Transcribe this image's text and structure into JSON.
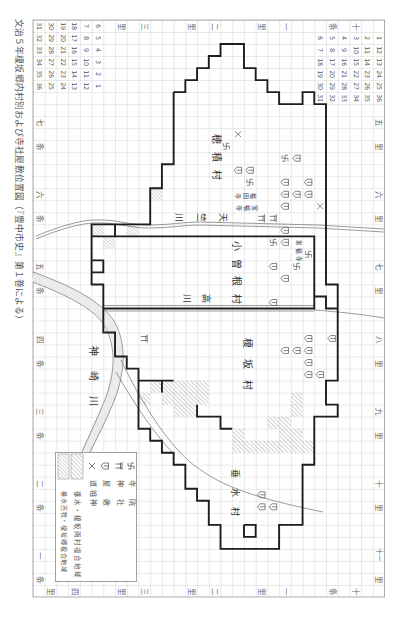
{
  "title": "文治５年榎坂郷内村別および寺社屋敷位置図（『豊中市史』第１巻による）",
  "colors": {
    "ink": "#1e1e1e",
    "grid": "#b4b4b4",
    "grid_border": "#9a9a9a",
    "line": "#707070",
    "symbol": "#666666",
    "river_fill": "#ebebeb",
    "hatch": "#8c8c8c"
  },
  "map": {
    "grid": {
      "x": 33,
      "y": 20,
      "cw": 11.72,
      "ch": 12.02,
      "cols": 30,
      "rows": 48
    },
    "number_blocks": [
      {
        "id": "left",
        "col": 0,
        "row": 0,
        "columns": [
          [
            "31",
            "32",
            "33",
            "34",
            "35",
            "36"
          ],
          [
            "30",
            "29",
            "28",
            "27",
            "26",
            "25"
          ],
          [
            "19",
            "20",
            "21",
            "22",
            "23",
            "24"
          ],
          [
            "18",
            "17",
            "16",
            "15",
            "14",
            "13"
          ],
          [
            "7",
            "8",
            "9",
            "10",
            "11",
            "12"
          ],
          [
            "6",
            "5",
            "4",
            "3",
            "2",
            "1"
          ]
        ]
      },
      {
        "id": "right",
        "col": 24,
        "row": 1,
        "columns": [
          [
            "6",
            "7",
            "18",
            "19",
            "30",
            "31"
          ],
          [
            "5",
            "8",
            "17",
            "20",
            "29",
            "32"
          ],
          [
            "4",
            "9",
            "16",
            "21",
            "28",
            "33"
          ],
          [
            "3",
            "10",
            "15",
            "22",
            "27",
            "34"
          ],
          [
            "2",
            "11",
            "14",
            "23",
            "26",
            "35"
          ],
          [
            "1",
            "12",
            "13",
            "24",
            "25",
            "36"
          ]
        ]
      }
    ],
    "grid_labels": [
      {
        "t": "七",
        "c": 0,
        "r": 8
      },
      {
        "t": "条",
        "c": 0,
        "r": 10
      },
      {
        "t": "六",
        "c": 0,
        "r": 14
      },
      {
        "t": "条",
        "c": 0,
        "r": 16
      },
      {
        "t": "五",
        "c": 0,
        "r": 20
      },
      {
        "t": "条",
        "c": 0,
        "r": 22
      },
      {
        "t": "四",
        "c": 0,
        "r": 26
      },
      {
        "t": "条",
        "c": 0,
        "r": 28
      },
      {
        "t": "三",
        "c": 0,
        "r": 32
      },
      {
        "t": "条",
        "c": 0,
        "r": 34
      },
      {
        "t": "二",
        "c": 0,
        "r": 38
      },
      {
        "t": "条",
        "c": 0,
        "r": 40
      },
      {
        "t": "一",
        "c": 0,
        "r": 44
      },
      {
        "t": "条",
        "c": 0,
        "r": 46
      },
      {
        "t": "五",
        "c": 29,
        "r": 8
      },
      {
        "t": "里",
        "c": 29,
        "r": 10
      },
      {
        "t": "六",
        "c": 29,
        "r": 14
      },
      {
        "t": "里",
        "c": 29,
        "r": 16
      },
      {
        "t": "七",
        "c": 29,
        "r": 20
      },
      {
        "t": "里",
        "c": 29,
        "r": 22
      },
      {
        "t": "八",
        "c": 29,
        "r": 26
      },
      {
        "t": "里",
        "c": 29,
        "r": 28
      },
      {
        "t": "九",
        "c": 29,
        "r": 32
      },
      {
        "t": "里",
        "c": 29,
        "r": 34
      },
      {
        "t": "十",
        "c": 29,
        "r": 38
      },
      {
        "t": "里",
        "c": 29,
        "r": 40
      },
      {
        "t": "十一",
        "c": 29,
        "r": 44
      },
      {
        "t": "里",
        "c": 29,
        "r": 46
      },
      {
        "t": "里",
        "c": 7,
        "r": 0
      },
      {
        "t": "三",
        "c": 9,
        "r": 0
      },
      {
        "t": "里",
        "c": 13,
        "r": 0
      },
      {
        "t": "二",
        "c": 15,
        "r": 0
      },
      {
        "t": "里",
        "c": 19,
        "r": 0
      },
      {
        "t": "一",
        "c": 21,
        "r": 0
      },
      {
        "t": "条",
        "c": 25,
        "r": 0
      },
      {
        "t": "十",
        "c": 27,
        "r": 0
      },
      {
        "t": "里",
        "c": 1,
        "r": 47
      },
      {
        "t": "四",
        "c": 3,
        "r": 47
      },
      {
        "t": "里",
        "c": 7,
        "r": 47
      },
      {
        "t": "三",
        "c": 9,
        "r": 47
      },
      {
        "t": "里",
        "c": 13,
        "r": 47
      },
      {
        "t": "二",
        "c": 15,
        "r": 47
      },
      {
        "t": "里",
        "c": 19,
        "r": 47
      },
      {
        "t": "一",
        "c": 21,
        "r": 47
      },
      {
        "t": "条",
        "c": 25,
        "r": 47
      },
      {
        "t": "十",
        "c": 27,
        "r": 47
      }
    ],
    "place_names": [
      {
        "id": "hozumi-village-label",
        "text": "穂積村",
        "x": 216,
        "y": 161,
        "size": 10,
        "span": 54,
        "dir": "tb"
      },
      {
        "id": "kosone-village-label",
        "text": "小曽根村",
        "x": 236,
        "y": 276,
        "size": 10,
        "span": 70,
        "dir": "tb"
      },
      {
        "id": "enosaka-village-label",
        "text": "榎坂村",
        "x": 247,
        "y": 369,
        "size": 10,
        "span": 63,
        "dir": "tb"
      },
      {
        "id": "tarumi-village-label",
        "text": "垂水村",
        "x": 234,
        "y": 497,
        "size": 9,
        "span": 57,
        "dir": "tb"
      },
      {
        "id": "kanzaki-river-label",
        "text": "神崎川",
        "x": 93,
        "y": 383,
        "size": 10,
        "span": 75,
        "dir": "tb"
      },
      {
        "id": "tenjiku-river-label",
        "text": "天竺川",
        "x": 195,
        "y": 217,
        "size": 9,
        "span": 66,
        "dir": "rl"
      },
      {
        "id": "takagawa-river-label",
        "text": "高川",
        "x": 192,
        "y": 298,
        "size": 9,
        "span": 38,
        "dir": "rl"
      },
      {
        "id": "temple-name-label",
        "text": "福田寺",
        "x": 245,
        "y": 195,
        "size": 6,
        "span": 22,
        "dir": "rl"
      },
      {
        "id": "temple-name-label",
        "text": "宝福寺",
        "x": 246,
        "y": 207,
        "size": 6,
        "span": 24,
        "dir": "rl"
      },
      {
        "id": "temple-name-label",
        "text": "常福寺",
        "x": 298,
        "y": 252,
        "size": 5.5,
        "span": 22,
        "dir": "tb"
      }
    ],
    "symbols": {
      "house": [
        [
          22,
          11
        ],
        [
          21,
          13
        ],
        [
          23,
          13
        ],
        [
          21,
          14
        ],
        [
          22,
          14
        ],
        [
          23,
          14
        ],
        [
          21,
          15
        ],
        [
          21,
          17
        ],
        [
          21,
          18
        ],
        [
          20,
          20
        ],
        [
          21,
          21
        ],
        [
          17,
          12
        ],
        [
          18,
          12
        ],
        [
          20,
          23
        ],
        [
          23,
          26
        ],
        [
          25,
          26
        ],
        [
          21,
          27
        ],
        [
          22,
          27
        ],
        [
          23,
          27
        ],
        [
          23,
          28
        ],
        [
          23,
          29
        ],
        [
          24,
          29
        ],
        [
          19,
          39
        ],
        [
          19,
          40
        ],
        [
          20,
          40
        ]
      ],
      "temple": [
        [
          16,
          10
        ],
        [
          18,
          13
        ],
        [
          21,
          11
        ],
        [
          20,
          18
        ],
        [
          23,
          19
        ],
        [
          22,
          20
        ]
      ],
      "shrine": [
        [
          19,
          16
        ],
        [
          20,
          16
        ],
        [
          9,
          26
        ]
      ],
      "dosojin": [
        [
          17,
          9
        ],
        [
          24,
          15
        ]
      ]
    },
    "hatched_cells": {
      "a": [
        [
          10,
          30
        ],
        [
          11,
          30
        ],
        [
          12,
          30
        ],
        [
          13,
          30
        ],
        [
          14,
          30
        ],
        [
          9,
          31
        ],
        [
          11,
          31
        ],
        [
          12,
          31
        ],
        [
          13,
          31
        ],
        [
          14,
          31
        ],
        [
          12,
          32
        ],
        [
          13,
          32
        ],
        [
          22,
          31
        ],
        [
          22,
          32
        ],
        [
          20,
          33
        ],
        [
          21,
          33
        ],
        [
          17,
          34
        ],
        [
          21,
          34
        ],
        [
          22,
          34
        ],
        [
          17,
          35
        ],
        [
          18,
          35
        ],
        [
          19,
          35
        ],
        [
          20,
          35
        ],
        [
          21,
          35
        ],
        [
          22,
          35
        ],
        [
          23,
          35
        ]
      ],
      "b": [
        [
          10,
          14
        ],
        [
          5,
          17
        ],
        [
          8,
          17
        ],
        [
          6,
          18
        ]
      ]
    },
    "boundary_outer": [
      [
        12,
        6
      ],
      [
        13,
        6
      ],
      [
        13,
        5
      ],
      [
        14,
        5
      ],
      [
        14,
        4
      ],
      [
        15,
        4
      ],
      [
        15,
        3
      ],
      [
        16,
        3
      ],
      [
        16,
        2
      ],
      [
        18,
        2
      ],
      [
        18,
        4
      ],
      [
        19,
        4
      ],
      [
        19,
        5
      ],
      [
        20,
        5
      ],
      [
        20,
        6
      ],
      [
        21,
        6
      ],
      [
        21,
        7
      ],
      [
        23,
        7
      ],
      [
        23,
        6
      ],
      [
        24,
        6
      ],
      [
        24,
        7
      ],
      [
        25,
        7
      ],
      [
        25,
        22
      ],
      [
        26,
        22
      ],
      [
        26,
        30
      ],
      [
        25,
        30
      ],
      [
        25,
        32
      ],
      [
        26,
        32
      ],
      [
        26,
        33
      ],
      [
        24,
        33
      ],
      [
        24,
        37
      ],
      [
        23,
        37
      ],
      [
        23,
        42
      ],
      [
        21,
        42
      ],
      [
        21,
        44
      ],
      [
        16,
        44
      ],
      [
        16,
        42
      ],
      [
        15,
        42
      ],
      [
        15,
        40
      ],
      [
        14,
        40
      ],
      [
        14,
        39
      ],
      [
        13,
        39
      ],
      [
        13,
        37
      ],
      [
        12,
        37
      ],
      [
        12,
        36
      ],
      [
        11,
        36
      ],
      [
        11,
        35
      ],
      [
        10,
        35
      ],
      [
        10,
        34
      ],
      [
        9,
        34
      ],
      [
        9,
        29
      ],
      [
        8,
        29
      ],
      [
        8,
        28
      ],
      [
        7,
        28
      ],
      [
        7,
        26
      ],
      [
        6,
        26
      ],
      [
        6,
        22
      ],
      [
        5,
        22
      ],
      [
        5,
        17
      ],
      [
        10,
        17
      ],
      [
        10,
        14
      ],
      [
        11,
        14
      ],
      [
        11,
        12
      ],
      [
        12,
        12
      ],
      [
        12,
        6
      ]
    ],
    "boundary_inner": [
      [
        [
          5,
          18
        ],
        [
          24,
          18
        ],
        [
          24,
          24
        ],
        [
          6,
          24
        ]
      ],
      [
        [
          7,
          17
        ],
        [
          7,
          18
        ]
      ],
      [
        [
          26,
          24
        ],
        [
          25,
          24
        ],
        [
          25,
          23
        ],
        [
          24,
          23
        ]
      ],
      [
        [
          9,
          30
        ],
        [
          12,
          30
        ]
      ],
      [
        [
          11,
          30
        ],
        [
          11,
          31
        ]
      ],
      [
        [
          14,
          32
        ],
        [
          14,
          33
        ],
        [
          16,
          33
        ],
        [
          16,
          34
        ],
        [
          17,
          34
        ]
      ],
      [
        [
          5,
          20
        ],
        [
          6,
          20
        ],
        [
          6,
          21
        ],
        [
          5,
          21
        ]
      ],
      [
        [
          18,
          42
        ],
        [
          19,
          42
        ],
        [
          19,
          43
        ],
        [
          18,
          43
        ],
        [
          18,
          42
        ]
      ]
    ],
    "waterways": [
      {
        "id": "tenjiku-river",
        "lines": [
          "M36,236 C58,227 80,220 95,220 C115,219 130,225 147,225 C170,225 185,222 200,222 L318,225 L384,229",
          "M36,239 C58,230 80,223 95,223 C115,222 130,228 147,228 C170,228 185,225 200,225 L318,228 L384,232"
        ]
      },
      {
        "id": "takagawa-river",
        "lines": [
          "M103,305.5 L314,305.5",
          "M103,311 L314,311",
          "M314,310 C340,312 360,314 384,318"
        ]
      },
      {
        "id": "kanzaki-river",
        "band": "M33,277 C59,287 92,300 107,320 C122,341 121,370 110,399 C102,419 93,437 86,452",
        "band_width": 9,
        "lines": [
          "M33,272 C60,282 95,296 112,318 C127,340 126,371 114,401 C106,421 97,438 90,452",
          "M33,282 C58,292 89,305 102,322 C116,342 116,369 106,397 C98,417 89,436 82,452"
        ]
      },
      {
        "id": "road",
        "lines": [
          "M121,360 C140,400 165,440 190,462 C215,482 240,495 323,512",
          "M116,372 C135,405 155,435 175,455"
        ]
      }
    ]
  },
  "legend": {
    "items": [
      {
        "symbol": "temple",
        "label": "寺院"
      },
      {
        "symbol": "shrine",
        "label": "神社"
      },
      {
        "symbol": "house",
        "label": "屋敷"
      },
      {
        "symbol": "dosojin",
        "label": "道祖神"
      },
      {
        "symbol": "hatch-a",
        "label": "垂水・榎坂両村複合地域"
      },
      {
        "symbol": "hatch-b",
        "label": "垂水西牧・榎坂郷複合地域"
      }
    ]
  }
}
